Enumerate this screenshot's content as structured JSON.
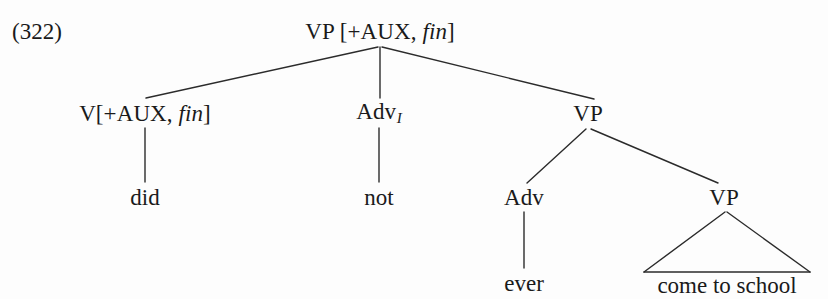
{
  "figure": {
    "example_number": "(322)",
    "kind": "syntax-tree",
    "line_color": "#2b2b2b",
    "background_color": "#fdfdfd"
  },
  "tree": {
    "nodes": [
      {
        "id": "vp-root",
        "name": "vp-root-node",
        "category": "VP",
        "features_open": " [+AUX, ",
        "features_italic": "fin",
        "features_close": "]",
        "x": 380,
        "y": 31
      },
      {
        "id": "v-aux",
        "name": "v-aux-node",
        "category": "V[+AUX, ",
        "features_italic": "fin",
        "features_close": "]",
        "x": 145,
        "y": 113
      },
      {
        "id": "adv-i",
        "name": "adv-i-node",
        "category": "Adv",
        "subscript": "I",
        "x": 379,
        "y": 113
      },
      {
        "id": "vp-mid",
        "name": "vp-middle-node",
        "category": "VP",
        "x": 588,
        "y": 113
      },
      {
        "id": "adv",
        "name": "adv-node",
        "category": "Adv",
        "x": 524,
        "y": 197
      },
      {
        "id": "vp-low",
        "name": "vp-lower-node",
        "category": "VP",
        "x": 724,
        "y": 197
      }
    ],
    "terminals": [
      {
        "id": "did",
        "name": "terminal-did",
        "text": "did",
        "x": 145,
        "y": 197
      },
      {
        "id": "not",
        "name": "terminal-not",
        "text": "not",
        "x": 379,
        "y": 197
      },
      {
        "id": "ever",
        "name": "terminal-ever",
        "text": "ever",
        "x": 524,
        "y": 283
      },
      {
        "id": "come",
        "name": "terminal-come-to-school",
        "text": "come to school",
        "x": 727,
        "y": 285
      }
    ],
    "edges": [
      {
        "name": "edge-root-to-v-aux",
        "x1": 378,
        "y1": 47,
        "x2": 146,
        "y2": 98
      },
      {
        "name": "edge-root-to-adv-i",
        "x1": 380,
        "y1": 47,
        "x2": 380,
        "y2": 98
      },
      {
        "name": "edge-root-to-vp-middle",
        "x1": 382,
        "y1": 47,
        "x2": 594,
        "y2": 99
      },
      {
        "name": "edge-v-aux-to-did",
        "x1": 145,
        "y1": 128,
        "x2": 145,
        "y2": 182
      },
      {
        "name": "edge-adv-i-to-not",
        "x1": 379,
        "y1": 128,
        "x2": 379,
        "y2": 182
      },
      {
        "name": "edge-vp-middle-to-adv",
        "x1": 586,
        "y1": 129,
        "x2": 527,
        "y2": 183
      },
      {
        "name": "edge-vp-middle-to-vp-lower",
        "x1": 591,
        "y1": 129,
        "x2": 718,
        "y2": 183
      },
      {
        "name": "edge-adv-to-ever",
        "x1": 524,
        "y1": 212,
        "x2": 524,
        "y2": 268
      },
      {
        "name": "edge-triangle-left",
        "x1": 725,
        "y1": 212,
        "x2": 644,
        "y2": 272
      },
      {
        "name": "edge-triangle-right",
        "x1": 727,
        "y1": 212,
        "x2": 810,
        "y2": 272
      },
      {
        "name": "edge-triangle-base",
        "x1": 644,
        "y1": 272,
        "x2": 810,
        "y2": 272
      }
    ]
  }
}
